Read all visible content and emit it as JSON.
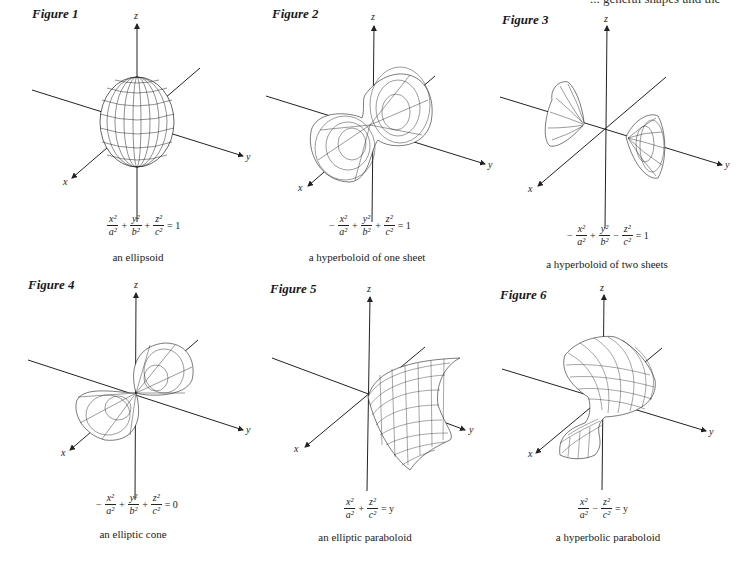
{
  "top_text_fragment": "... general shapes and the",
  "figures": [
    {
      "title": "Figure 1",
      "surface": "ellipsoid",
      "equation": {
        "terms": [
          {
            "sign": "",
            "num": "x²",
            "den": "a²"
          },
          {
            "sign": "+",
            "num": "y²",
            "den": "b²"
          },
          {
            "sign": "+",
            "num": "z²",
            "den": "c²"
          }
        ],
        "rhs": "= 1"
      },
      "caption": "an ellipsoid",
      "axes": {
        "x": "x",
        "y": "y",
        "z": "z"
      }
    },
    {
      "title": "Figure 2",
      "surface": "hyperboloid-one-sheet",
      "equation": {
        "terms": [
          {
            "sign": "−",
            "num": "x²",
            "den": "a²"
          },
          {
            "sign": "+",
            "num": "y²",
            "den": "b²"
          },
          {
            "sign": "+",
            "num": "z²",
            "den": "c²"
          }
        ],
        "rhs": "= 1"
      },
      "caption": "a hyperboloid of one sheet",
      "axes": {
        "x": "x",
        "y": "y",
        "z": "z"
      }
    },
    {
      "title": "Figure 3",
      "surface": "hyperboloid-two-sheets",
      "equation": {
        "terms": [
          {
            "sign": "−",
            "num": "x²",
            "den": "a²"
          },
          {
            "sign": "+",
            "num": "y²",
            "den": "b²"
          },
          {
            "sign": "−",
            "num": "z²",
            "den": "c²"
          }
        ],
        "rhs": "= 1"
      },
      "caption": "a hyperboloid of  two sheets",
      "axes": {
        "x": "x",
        "y": "y",
        "z": "z"
      }
    },
    {
      "title": "Figure 4",
      "surface": "elliptic-cone",
      "equation": {
        "terms": [
          {
            "sign": "−",
            "num": "x²",
            "den": "a²"
          },
          {
            "sign": "+",
            "num": "y²",
            "den": "b²"
          },
          {
            "sign": "+",
            "num": "z²",
            "den": "c²"
          }
        ],
        "rhs": "= 0"
      },
      "caption": "an elliptic cone",
      "axes": {
        "x": "x",
        "y": "y",
        "z": "z"
      }
    },
    {
      "title": "Figure 5",
      "surface": "elliptic-paraboloid",
      "equation": {
        "terms": [
          {
            "sign": "",
            "num": "x²",
            "den": "a²"
          },
          {
            "sign": "+",
            "num": "z²",
            "den": "c²"
          }
        ],
        "rhs": "= y"
      },
      "caption": "an elliptic paraboloid",
      "axes": {
        "x": "x",
        "y": "y",
        "z": "z"
      }
    },
    {
      "title": "Figure 6",
      "surface": "hyperbolic-paraboloid",
      "equation": {
        "terms": [
          {
            "sign": "",
            "num": "x²",
            "den": "a²"
          },
          {
            "sign": "−",
            "num": "z²",
            "den": "c²"
          }
        ],
        "rhs": "= y"
      },
      "caption": "a hyperbolic paraboloid",
      "axes": {
        "x": "x",
        "y": "y",
        "z": "z"
      }
    }
  ],
  "colors": {
    "ink": "#1a1a1a",
    "background": "#ffffff"
  }
}
